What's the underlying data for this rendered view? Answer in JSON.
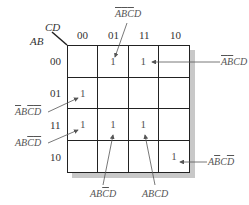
{
  "kmap": {
    "row_var": "AB",
    "col_var": "CD",
    "col_headers": [
      "00",
      "01",
      "11",
      "10"
    ],
    "row_headers": [
      "00",
      "01",
      "11",
      "10"
    ],
    "cells": [
      [
        "",
        "1",
        "1",
        ""
      ],
      [
        "1",
        "",
        "",
        ""
      ],
      [
        "1",
        "1",
        "1",
        ""
      ],
      [
        "",
        "",
        "",
        "1"
      ]
    ]
  },
  "annotations": {
    "top": {
      "letters": [
        "A",
        "B",
        "C",
        "D"
      ],
      "bars": [
        true,
        true,
        true,
        false
      ],
      "text": "A̅B̅C̅D",
      "cell": "00-01"
    },
    "right_top": {
      "letters": [
        "A",
        "B",
        "C",
        "D"
      ],
      "bars": [
        true,
        true,
        false,
        false
      ],
      "text": "A̅B̅CD",
      "cell": "00-11"
    },
    "left_01": {
      "letters": [
        "A",
        "B",
        "C",
        "D"
      ],
      "bars": [
        true,
        false,
        true,
        true
      ],
      "text": "A̅BC̅D̅",
      "cell": "01-00"
    },
    "left_11": {
      "letters": [
        "A",
        "B",
        "C",
        "D"
      ],
      "bars": [
        false,
        false,
        true,
        true
      ],
      "text": "ABC̅D̅",
      "cell": "11-00"
    },
    "right_bottom": {
      "letters": [
        "A",
        "B",
        "C",
        "D"
      ],
      "bars": [
        false,
        true,
        false,
        true
      ],
      "text": "AB̅CD̅",
      "cell": "10-10"
    },
    "bottom_left": {
      "letters": [
        "A",
        "B",
        "C",
        "D"
      ],
      "bars": [
        false,
        false,
        true,
        false
      ],
      "text": "ABC̅D",
      "cell": "11-01"
    },
    "bottom_right": {
      "letters": [
        "A",
        "B",
        "C",
        "D"
      ],
      "bars": [
        false,
        false,
        false,
        false
      ],
      "text": "ABCD",
      "cell": "11-11"
    }
  }
}
